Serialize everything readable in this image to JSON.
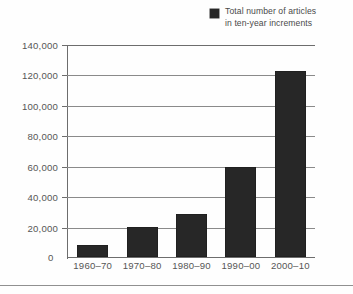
{
  "legend": {
    "label": "Total number of articles\nin ten-year increments",
    "swatch_color": "#272727",
    "swatch_name": "legend-color-swatch"
  },
  "axes": {
    "y_ticks": [
      "140,000",
      "120,000",
      "100,000",
      "80,000",
      "60,000",
      "40,000",
      "20,000",
      "0"
    ],
    "zero_label": "0",
    "x_ticks": [
      "1960–70",
      "1970–80",
      "1980–90",
      "1990–00",
      "2000–10"
    ]
  },
  "colors": {
    "bar": "#272727",
    "gridline": "#8a8a8a",
    "axis": "#6d6d6d",
    "text": "#565656",
    "background": "#fefefe"
  },
  "chart_data": {
    "type": "bar",
    "title": "",
    "xlabel": "",
    "ylabel": "",
    "categories": [
      "1960–70",
      "1970–80",
      "1980–90",
      "1990–00",
      "2000–10"
    ],
    "values": [
      8000,
      20000,
      28000,
      59000,
      122000
    ],
    "series": [
      {
        "name": "Total number of articles in ten-year increments",
        "values": [
          8000,
          20000,
          28000,
          59000,
          122000
        ]
      }
    ],
    "ylim": [
      0,
      140000
    ],
    "ytick_values": [
      0,
      20000,
      40000,
      60000,
      80000,
      100000,
      120000,
      140000
    ],
    "grid": true,
    "legend_position": "top-right"
  }
}
